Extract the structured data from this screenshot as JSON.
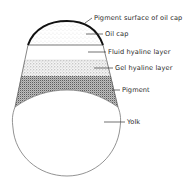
{
  "diagram": {
    "labels": [
      {
        "id": "pigment-surface",
        "text": "Pigment surface of oil cap",
        "x": 94,
        "y": 15
      },
      {
        "id": "oil-cap",
        "text": "Oil cap",
        "x": 105,
        "y": 31
      },
      {
        "id": "fluid-hyaline",
        "text": "Fluid hyaline layer",
        "x": 108,
        "y": 49
      },
      {
        "id": "gel-hyaline",
        "text": "Gel hyaline layer",
        "x": 115,
        "y": 65
      },
      {
        "id": "pigment",
        "text": "Pigment",
        "x": 122,
        "y": 87
      },
      {
        "id": "yolk",
        "text": "Yolk",
        "x": 127,
        "y": 119
      }
    ],
    "colors": {
      "outline": "#555555",
      "cap_surface": "#111111",
      "stipple_light": "#bdbdbd",
      "stipple_dark": "#6a6a6a",
      "background": "#ffffff"
    }
  }
}
